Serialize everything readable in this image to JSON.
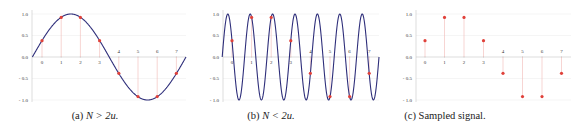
{
  "colors": {
    "curve": "#2e2e7a",
    "sample": "#e0413a",
    "stem": "#f2b8b5",
    "axis": "#c8c8c8",
    "grid": "#e6e6e6"
  },
  "chart_data": [
    {
      "id": "a",
      "type": "line",
      "title": "(a) N > 2u.",
      "caption_prefix": "(a) ",
      "caption_math": "N > 2u.",
      "xlabel": "",
      "ylabel": "",
      "ylim": [
        -1.0,
        1.0
      ],
      "xlim": [
        -0.5,
        7.5
      ],
      "yticks": [
        "1.0",
        "0.5",
        "0.0",
        "- 0.5",
        "- 1.0"
      ],
      "ytick_values": [
        1.0,
        0.5,
        0.0,
        -0.5,
        -1.0
      ],
      "xticks": [
        "0",
        "1",
        "2",
        "3",
        "4",
        "5",
        "6",
        "7"
      ],
      "curve": {
        "function": "sin",
        "cycles_over_range": 1,
        "description": "sin(2π·(t+0.5)/8)"
      },
      "samples": {
        "x": [
          0,
          1,
          2,
          3,
          4,
          5,
          6,
          7
        ],
        "y": [
          0.38,
          0.92,
          0.92,
          0.38,
          -0.38,
          -0.92,
          -0.92,
          -0.38
        ]
      },
      "show_curve": true,
      "show_stems": true
    },
    {
      "id": "b",
      "type": "line",
      "title": "(b) N < 2u.",
      "caption_prefix": "(b) ",
      "caption_math": "N < 2u.",
      "xlabel": "",
      "ylabel": "",
      "ylim": [
        -1.0,
        1.0
      ],
      "xlim": [
        -0.5,
        7.5
      ],
      "yticks": [
        "1.0",
        "0.5",
        "0.0",
        "- 0.5",
        "- 1.0"
      ],
      "ytick_values": [
        1.0,
        0.5,
        0.0,
        -0.5,
        -1.0
      ],
      "xticks": [
        "0",
        "1",
        "2",
        "3",
        "4",
        "5",
        "6",
        "7"
      ],
      "curve": {
        "function": "sin",
        "cycles_over_range": 7,
        "description": "sin(2π·7·(t+0.5)/8) (aliased)"
      },
      "samples": {
        "x": [
          0,
          1,
          2,
          3,
          4,
          5,
          6,
          7
        ],
        "y": [
          0.38,
          0.92,
          0.92,
          0.38,
          -0.38,
          -0.92,
          -0.92,
          -0.38
        ]
      },
      "show_curve": true,
      "show_stems": true
    },
    {
      "id": "c",
      "type": "scatter",
      "title": "(c) Sampled signal.",
      "caption_prefix": "(c) ",
      "caption_math": "",
      "caption_text": "Sampled signal.",
      "xlabel": "",
      "ylabel": "",
      "ylim": [
        -1.0,
        1.0
      ],
      "xlim": [
        -0.5,
        7.5
      ],
      "yticks": [
        "1.0",
        "0.5",
        "0.0",
        "- 0.5",
        "- 1.0"
      ],
      "ytick_values": [
        1.0,
        0.5,
        0.0,
        -0.5,
        -1.0
      ],
      "xticks": [
        "0",
        "1",
        "2",
        "3",
        "4",
        "5",
        "6",
        "7"
      ],
      "samples": {
        "x": [
          0,
          1,
          2,
          3,
          4,
          5,
          6,
          7
        ],
        "y": [
          0.38,
          0.92,
          0.92,
          0.38,
          -0.38,
          -0.92,
          -0.92,
          -0.38
        ]
      },
      "show_curve": false,
      "show_stems": true
    }
  ],
  "captions": {
    "a_prefix": "(a) ",
    "a_math": "N > 2u.",
    "b_prefix": "(b) ",
    "b_math": "N < 2u.",
    "c_text": "(c) Sampled signal."
  }
}
